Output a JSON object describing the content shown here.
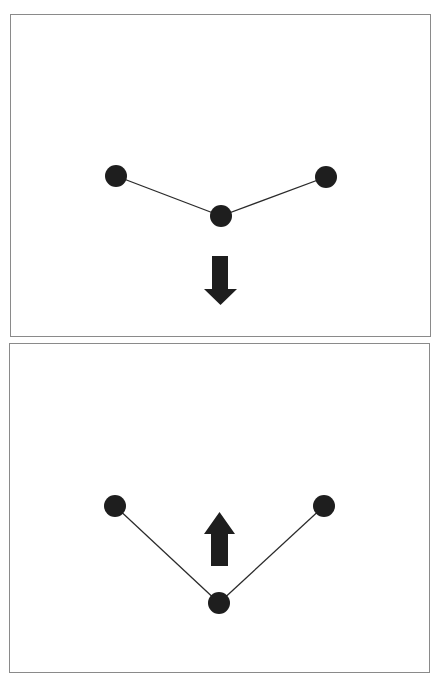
{
  "figure": {
    "panels": [
      {
        "id": "top",
        "label": "Bent chain with downward arrow",
        "arrow_direction": "down",
        "nodes": [
          {
            "name": "left",
            "x": 115,
            "y": 175,
            "r": 11
          },
          {
            "name": "center",
            "x": 220,
            "y": 215,
            "r": 11
          },
          {
            "name": "right",
            "x": 325,
            "y": 176,
            "r": 11
          }
        ],
        "edges": [
          [
            "left",
            "center"
          ],
          [
            "center",
            "right"
          ]
        ]
      },
      {
        "id": "bottom",
        "label": "Deeper V chain with upward arrow",
        "arrow_direction": "up",
        "nodes": [
          {
            "name": "left",
            "x": 114,
            "y": 505,
            "r": 11
          },
          {
            "name": "center",
            "x": 218,
            "y": 602,
            "r": 11
          },
          {
            "name": "right",
            "x": 323,
            "y": 505,
            "r": 11
          }
        ],
        "edges": [
          [
            "left",
            "center"
          ],
          [
            "center",
            "right"
          ]
        ]
      }
    ],
    "colors": {
      "node_fill": "#1e1e1e",
      "edge_stroke": "#2a2a2a",
      "arrow_fill": "#1e1e1e",
      "panel_border": "#8a8a8a",
      "background": "#ffffff"
    },
    "icons": {
      "down_arrow": "arrow-down-icon",
      "up_arrow": "arrow-up-icon"
    }
  }
}
